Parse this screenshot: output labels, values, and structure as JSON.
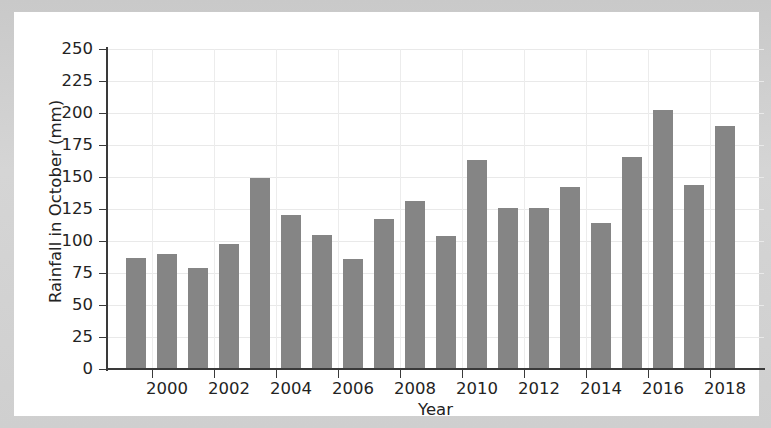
{
  "chart_data": {
    "type": "bar",
    "title": "",
    "xlabel": "Year",
    "ylabel": "Rainfall in October (mm)",
    "categories": [
      "1999",
      "2000",
      "2001",
      "2002",
      "2003",
      "2004",
      "2005",
      "2006",
      "2007",
      "2008",
      "2009",
      "2010",
      "2011",
      "2012",
      "2013",
      "2014",
      "2015",
      "2016",
      "2017",
      "2018"
    ],
    "values": [
      87,
      90,
      79,
      98,
      149,
      120,
      105,
      86,
      117,
      131,
      104,
      163,
      126,
      126,
      142,
      114,
      166,
      202,
      144,
      190
    ],
    "ylim": [
      0,
      250
    ],
    "yticks": [
      0,
      25,
      50,
      75,
      100,
      125,
      150,
      175,
      200,
      225,
      250
    ],
    "ytick_labels": [
      "0",
      "25",
      "50",
      "75",
      "100",
      "125",
      "150",
      "175",
      "200",
      "225",
      "250"
    ],
    "xtick_labels": [
      "2000",
      "2002",
      "2004",
      "2006",
      "2008",
      "2010",
      "2012",
      "2014",
      "2016",
      "2018"
    ],
    "xtick_categories": [
      "2000",
      "2002",
      "2004",
      "2006",
      "2008",
      "2010",
      "2012",
      "2014",
      "2016",
      "2018"
    ],
    "grid": true,
    "legend": null,
    "bar_color": "#858585",
    "axis_color": "#3a3a3a",
    "grid_color": "#e9e9e9",
    "background_color": "#ffffff",
    "figure_border_color": "#cfcfcf"
  }
}
